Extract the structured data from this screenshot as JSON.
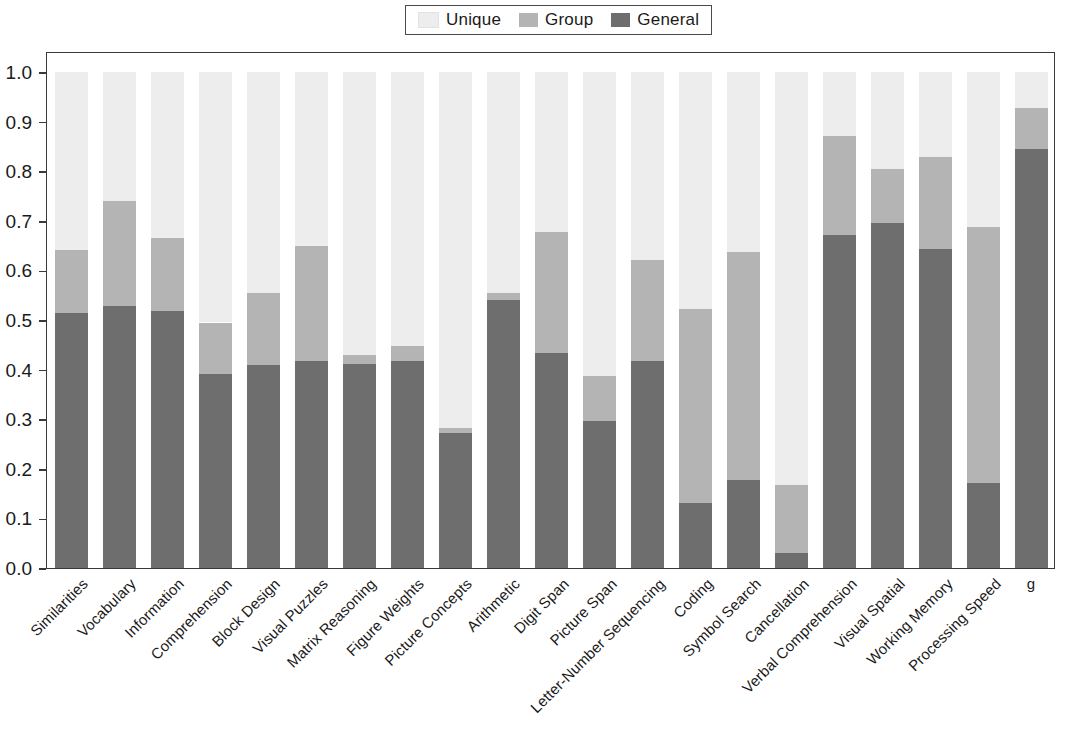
{
  "legend": {
    "position": "top-center",
    "entries": [
      {
        "label": "Unique",
        "color": "#ededed"
      },
      {
        "label": "Group",
        "color": "#b4b4b4"
      },
      {
        "label": "General",
        "color": "#6e6e6e"
      }
    ]
  },
  "axes": {
    "y_ticks": [
      "0.0",
      "0.1",
      "0.2",
      "0.3",
      "0.4",
      "0.5",
      "0.6",
      "0.7",
      "0.8",
      "0.9",
      "1.0"
    ],
    "y_min": 0.0,
    "y_max": 1.0,
    "x_title": "",
    "y_title": ""
  },
  "chart_data": {
    "type": "bar",
    "stacked": true,
    "title": "",
    "subtitle": "",
    "xlabel": "",
    "ylabel": "",
    "ylim": [
      0.0,
      1.0
    ],
    "ytick_values": [
      0.0,
      0.1,
      0.2,
      0.3,
      0.4,
      0.5,
      0.6,
      0.7,
      0.8,
      0.9,
      1.0
    ],
    "grid": false,
    "legend_position": "top-center",
    "categories": [
      "Similarities",
      "Vocabulary",
      "Information",
      "Comprehension",
      "Block Design",
      "Visual Puzzles",
      "Matrix Reasoning",
      "Figure Weights",
      "Picture Concepts",
      "Arithmetic",
      "Digit Span",
      "Picture Span",
      "Letter-Number Sequencing",
      "Coding",
      "Symbol Search",
      "Cancellation",
      "Verbal Comprehension",
      "Visual Spatial",
      "Working Memory",
      "Processing Speed",
      "g"
    ],
    "series": [
      {
        "name": "General",
        "color": "#6e6e6e",
        "values": [
          0.515,
          0.528,
          0.518,
          0.391,
          0.409,
          0.417,
          0.411,
          0.418,
          0.273,
          0.541,
          0.433,
          0.297,
          0.418,
          0.131,
          0.177,
          0.031,
          0.671,
          0.696,
          0.644,
          0.171,
          0.845
        ]
      },
      {
        "name": "Group",
        "color": "#b4b4b4",
        "values": [
          0.126,
          0.212,
          0.147,
          0.104,
          0.146,
          0.233,
          0.019,
          0.029,
          0.009,
          0.014,
          0.244,
          0.09,
          0.204,
          0.392,
          0.461,
          0.136,
          0.201,
          0.109,
          0.184,
          0.517,
          0.083
        ]
      },
      {
        "name": "Unique",
        "color": "#ededed",
        "values": [
          0.359,
          0.26,
          0.335,
          0.505,
          0.445,
          0.35,
          0.57,
          0.553,
          0.718,
          0.445,
          0.323,
          0.613,
          0.378,
          0.477,
          0.362,
          0.833,
          0.128,
          0.195,
          0.172,
          0.312,
          0.072
        ]
      }
    ],
    "cumulative_tops": {
      "general": [
        0.515,
        0.528,
        0.518,
        0.391,
        0.409,
        0.417,
        0.411,
        0.418,
        0.273,
        0.541,
        0.433,
        0.297,
        0.418,
        0.131,
        0.177,
        0.031,
        0.671,
        0.696,
        0.644,
        0.171,
        0.845
      ],
      "group": [
        0.641,
        0.74,
        0.665,
        0.495,
        0.555,
        0.65,
        0.43,
        0.447,
        0.282,
        0.555,
        0.677,
        0.387,
        0.622,
        0.523,
        0.638,
        0.167,
        0.872,
        0.805,
        0.828,
        0.688,
        0.928
      ],
      "unique": [
        1.0,
        1.0,
        1.0,
        1.0,
        1.0,
        1.0,
        1.0,
        1.0,
        1.0,
        1.0,
        1.0,
        1.0,
        1.0,
        1.0,
        1.0,
        1.0,
        1.0,
        1.0,
        1.0,
        1.0,
        1.0
      ]
    }
  }
}
